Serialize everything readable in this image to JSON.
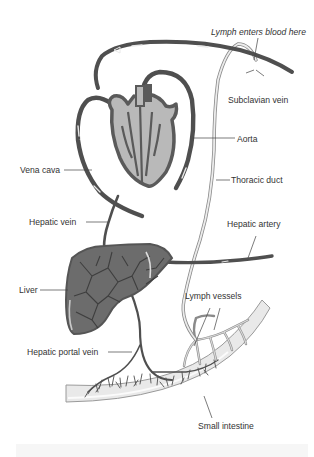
{
  "diagram": {
    "colors": {
      "vessel_dark": "#4f4f4f",
      "vessel_highlight": "#e8e8e8",
      "heart_fill": "#b9b9b9",
      "heart_outline": "#5a5a5a",
      "liver_fill": "#6c6c6c",
      "liver_mesh": "#3e3e3e",
      "lymph_vessel": "#d9d9d9",
      "lymph_outline": "#8a8a8a",
      "intestine_fill": "#e9e9e9",
      "intestine_edge": "#9a9a9a",
      "label_text": "#333333",
      "leader_line": "#444444"
    },
    "labels": {
      "lymph_enters": "Lymph enters blood here",
      "subclavian_vein": "Subclavian vein",
      "aorta": "Aorta",
      "vena_cava": "Vena cava",
      "thoracic_duct": "Thoracic duct",
      "hepatic_vein": "Hepatic vein",
      "hepatic_artery": "Hepatic artery",
      "liver": "Liver",
      "lymph_vessels": "Lymph vessels",
      "hepatic_portal_vein": "Hepatic portal vein",
      "small_intestine": "Small intestine"
    },
    "structures": [
      "heart",
      "liver",
      "small intestine",
      "subclavian vein",
      "aorta",
      "vena cava",
      "thoracic duct",
      "hepatic vein",
      "hepatic artery",
      "hepatic portal vein",
      "lymph vessels"
    ]
  }
}
